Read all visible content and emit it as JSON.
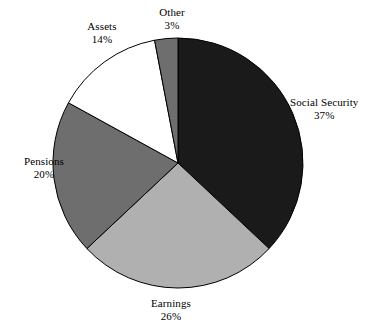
{
  "chart_data": {
    "type": "pie",
    "title": "",
    "subtitle": "",
    "xlabel": "",
    "ylabel": "",
    "legend_position": "none",
    "grid": false,
    "units": "percent",
    "total": 100,
    "start_angle_deg": 0,
    "direction": "clockwise",
    "categories": [
      "Social Security",
      "Earnings",
      "Pensions",
      "Assets",
      "Other"
    ],
    "values": [
      37,
      26,
      20,
      14,
      3
    ],
    "slices": [
      {
        "name": "Social Security",
        "value": 37,
        "value_label": "37%",
        "color": "#1a1a1a",
        "start_deg": 0,
        "end_deg": 133.2,
        "label_position": "right"
      },
      {
        "name": "Earnings",
        "value": 26,
        "value_label": "26%",
        "color": "#b0b0b0",
        "start_deg": 133.2,
        "end_deg": 226.8,
        "label_position": "bottom"
      },
      {
        "name": "Pensions",
        "value": 20,
        "value_label": "20%",
        "color": "#6e6e6e",
        "start_deg": 226.8,
        "end_deg": 298.8,
        "label_position": "left"
      },
      {
        "name": "Assets",
        "value": 14,
        "value_label": "14%",
        "color": "#ffffff",
        "start_deg": 298.8,
        "end_deg": 349.2,
        "label_position": "top-left"
      },
      {
        "name": "Other",
        "value": 3,
        "value_label": "3%",
        "color": "#6e6e6e",
        "start_deg": 349.2,
        "end_deg": 360,
        "label_position": "top"
      }
    ],
    "stroke_color": "#000000",
    "background_color": "#ffffff",
    "center": {
      "x": 178,
      "y": 163
    },
    "radius": 125
  },
  "labels": {
    "social_security": {
      "name": "Social Security",
      "value": "37%"
    },
    "earnings": {
      "name": "Earnings",
      "value": "26%"
    },
    "pensions": {
      "name": "Pensions",
      "value": "20%"
    },
    "assets": {
      "name": "Assets",
      "value": "14%"
    },
    "other": {
      "name": "Other",
      "value": "3%"
    }
  }
}
